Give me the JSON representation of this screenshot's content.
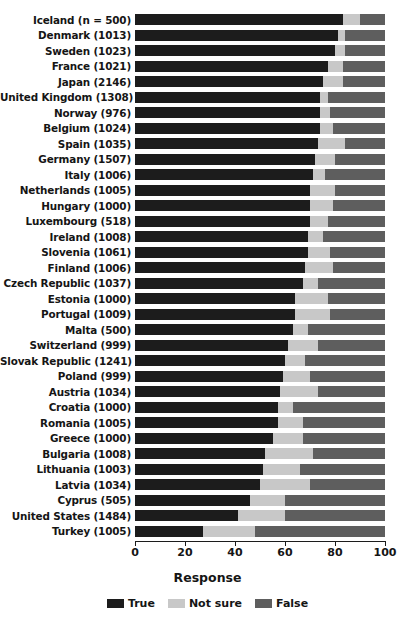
{
  "chart_data": {
    "type": "bar",
    "subtype": "stacked-horizontal-100pct",
    "title": "",
    "xlabel": "Response",
    "ylabel": "",
    "xlim": [
      0,
      100
    ],
    "xticks": [
      0,
      20,
      40,
      60,
      80,
      100
    ],
    "grid": false,
    "legend_position": "bottom-center",
    "legend": [
      "True",
      "Not sure",
      "False"
    ],
    "colors": {
      "True": "#1c1c1c",
      "Not sure": "#c8c8c8",
      "False": "#5e5e5e"
    },
    "categories": [
      "Iceland (n = 500)",
      "Denmark (1013)",
      "Sweden (1023)",
      "France (1021)",
      "Japan (2146)",
      "United Kingdom (1308)",
      "Norway (976)",
      "Belgium (1024)",
      "Spain (1035)",
      "Germany (1507)",
      "Italy (1006)",
      "Netherlands (1005)",
      "Hungary (1000)",
      "Luxembourg (518)",
      "Ireland (1008)",
      "Slovenia (1061)",
      "Finland (1006)",
      "Czech Republic (1037)",
      "Estonia (1000)",
      "Portugal (1009)",
      "Malta (500)",
      "Switzerland (999)",
      "Slovak Republic (1241)",
      "Poland (999)",
      "Austria (1034)",
      "Croatia (1000)",
      "Romania (1005)",
      "Greece (1000)",
      "Bulgaria (1008)",
      "Lithuania (1003)",
      "Latvia (1034)",
      "Cyprus (505)",
      "United States (1484)",
      "Turkey (1005)"
    ],
    "series": [
      {
        "name": "True",
        "values": [
          83,
          81,
          80,
          77,
          75,
          74,
          74,
          74,
          73,
          72,
          71,
          70,
          70,
          70,
          69,
          69,
          68,
          67,
          64,
          64,
          63,
          61,
          60,
          59,
          58,
          57,
          57,
          55,
          52,
          51,
          50,
          46,
          41,
          27
        ]
      },
      {
        "name": "Not sure",
        "values": [
          7,
          3,
          4,
          6,
          8,
          3,
          4,
          5,
          11,
          8,
          5,
          10,
          9,
          7,
          6,
          9,
          11,
          6,
          13,
          14,
          6,
          12,
          8,
          11,
          15,
          6,
          10,
          12,
          19,
          15,
          20,
          14,
          19,
          21
        ]
      },
      {
        "name": "False",
        "values": [
          10,
          16,
          16,
          17,
          17,
          23,
          22,
          21,
          16,
          20,
          24,
          20,
          21,
          23,
          25,
          22,
          21,
          27,
          23,
          22,
          31,
          27,
          32,
          30,
          27,
          37,
          33,
          33,
          29,
          34,
          30,
          40,
          40,
          52
        ]
      }
    ]
  },
  "axis": {
    "x_title": "Response",
    "tick_labels": [
      "0",
      "20",
      "40",
      "60",
      "80",
      "100"
    ]
  }
}
